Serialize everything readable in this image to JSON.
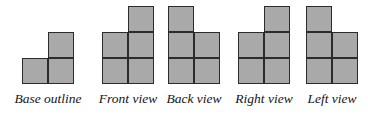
{
  "figure": {
    "background_color": "#ffffff",
    "cell_fill_color": "#a9a9a9",
    "cell_stroke_color": "#2b2b2b",
    "label_color": "#141414",
    "cell_size_px": 26,
    "views": [
      {
        "id": "base-outline",
        "label": "Base outline",
        "group_left": 4,
        "group_width": 88,
        "rows": 2,
        "cells": [
          {
            "col": 1,
            "row": 0
          },
          {
            "col": 0,
            "row": 1
          },
          {
            "col": 1,
            "row": 1
          }
        ]
      },
      {
        "id": "front-view",
        "label": "Front view",
        "group_left": 92,
        "group_width": 72,
        "rows": 3,
        "cells": [
          {
            "col": 1,
            "row": 0
          },
          {
            "col": 0,
            "row": 1
          },
          {
            "col": 1,
            "row": 1
          },
          {
            "col": 0,
            "row": 2
          },
          {
            "col": 1,
            "row": 2
          }
        ]
      },
      {
        "id": "back-view",
        "label": "Back view",
        "group_left": 160,
        "group_width": 68,
        "rows": 3,
        "cells": [
          {
            "col": 0,
            "row": 0
          },
          {
            "col": 0,
            "row": 1
          },
          {
            "col": 1,
            "row": 1
          },
          {
            "col": 0,
            "row": 2
          },
          {
            "col": 1,
            "row": 2
          }
        ]
      },
      {
        "id": "right-view",
        "label": "Right view",
        "group_left": 228,
        "group_width": 72,
        "rows": 3,
        "cells": [
          {
            "col": 1,
            "row": 0
          },
          {
            "col": 0,
            "row": 1
          },
          {
            "col": 1,
            "row": 1
          },
          {
            "col": 0,
            "row": 2
          },
          {
            "col": 1,
            "row": 2
          }
        ]
      },
      {
        "id": "left-view",
        "label": "Left view",
        "group_left": 298,
        "group_width": 68,
        "rows": 3,
        "cells": [
          {
            "col": 0,
            "row": 0
          },
          {
            "col": 0,
            "row": 1
          },
          {
            "col": 1,
            "row": 1
          },
          {
            "col": 0,
            "row": 2
          },
          {
            "col": 1,
            "row": 2
          }
        ]
      }
    ]
  }
}
